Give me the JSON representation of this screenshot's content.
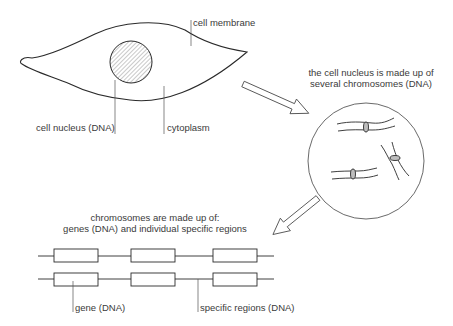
{
  "diagram": {
    "cell": {
      "labels": {
        "membrane": "cell membrane",
        "nucleus": "cell nucleus (DNA)",
        "cytoplasm": "cytoplasm"
      }
    },
    "nucleus_zoom": {
      "caption_line1": "the cell nucleus is made up of",
      "caption_line2": "several chromosomes (DNA)"
    },
    "chromosome_detail": {
      "caption_line1": "chromosomes are made up of:",
      "caption_line2": "genes (DNA) and individual specific regions",
      "labels": {
        "gene": "gene (DNA)",
        "specific_regions": "specific regions (DNA)"
      }
    },
    "colors": {
      "stroke": "#2a2a2a",
      "leader": "#555555",
      "centromere_fill": "#bdbdbd"
    }
  }
}
